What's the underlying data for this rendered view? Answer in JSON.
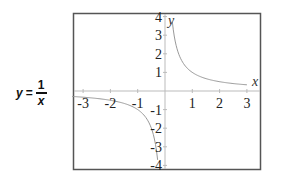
{
  "formula": {
    "lhs": "y",
    "eq": "=",
    "numerator": "1",
    "denominator": "x"
  },
  "chart_data": {
    "type": "line",
    "xlabel": "x",
    "ylabel": "y",
    "xlim": [
      -3.4,
      3.4
    ],
    "ylim": [
      -4.2,
      4.2
    ],
    "grid": false,
    "legend": "none",
    "x_ticks": [
      "-3",
      "-2",
      "-1",
      "1",
      "2",
      "3"
    ],
    "y_ticks": [
      "4",
      "3",
      "2",
      "1",
      "-1",
      "-2",
      "-3",
      "-4"
    ],
    "series": [
      {
        "name": "y = 1/x (x > 0)",
        "x": [
          0.27,
          0.3,
          0.4,
          0.5,
          0.75,
          1,
          1.5,
          2,
          2.5,
          3
        ],
        "y": [
          3.7,
          3.33,
          2.5,
          2,
          1.33,
          1,
          0.67,
          0.5,
          0.4,
          0.33
        ]
      },
      {
        "name": "y = 1/x (x < 0)",
        "x": [
          -3.4,
          -3,
          -2.5,
          -2,
          -1.5,
          -1,
          -0.75,
          -0.5,
          -0.4,
          -0.3,
          -0.27
        ],
        "y": [
          -0.29,
          -0.33,
          -0.4,
          -0.5,
          -0.67,
          -1,
          -1.33,
          -2,
          -2.5,
          -3.33,
          -3.7
        ]
      }
    ]
  },
  "colors": {
    "frame": "#555555",
    "axes": "#bbbbbb",
    "curve": "#999999",
    "text": "#222222"
  }
}
